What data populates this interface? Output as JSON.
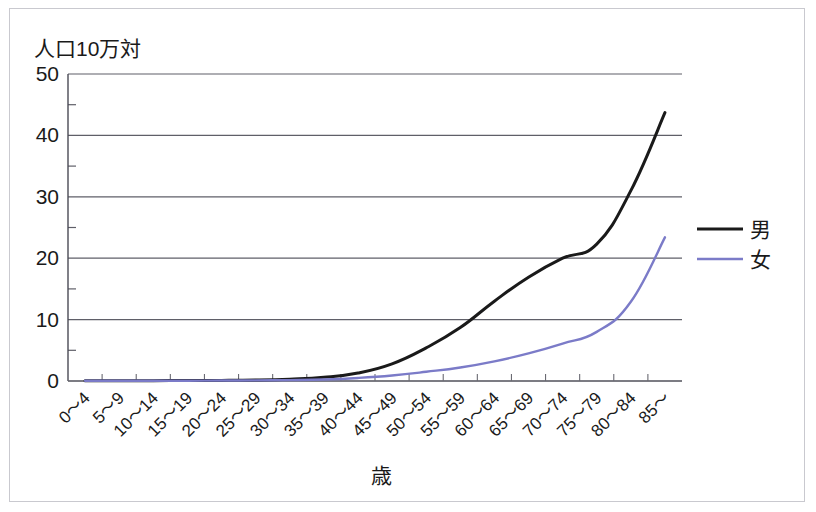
{
  "chart_data": {
    "type": "line",
    "title": "",
    "ylabel": "人口10万対",
    "xlabel": "歳",
    "ylim": [
      0,
      50
    ],
    "yticks": [
      0,
      10,
      20,
      30,
      40,
      50
    ],
    "ytick_labels": [
      "0",
      "10",
      "20",
      "30",
      "40",
      "50"
    ],
    "minor_ytick_step": 5,
    "grid": "horizontal",
    "legend_position": "right",
    "categories": [
      "0～4",
      "5～9",
      "10～14",
      "15～19",
      "20～24",
      "25～29",
      "30～34",
      "35～39",
      "40～44",
      "45～49",
      "50～54",
      "55～59",
      "60～64",
      "65～69",
      "70～74",
      "75～79",
      "80～84",
      "85～"
    ],
    "series": [
      {
        "name": "男",
        "color": "#1a1a1a",
        "values": [
          0.05,
          0.05,
          0.05,
          0.1,
          0.1,
          0.15,
          0.3,
          0.6,
          1.3,
          2.8,
          5.4,
          8.7,
          13.0,
          16.9,
          20.0,
          22.3,
          31.0,
          43.7
        ]
      },
      {
        "name": "女",
        "color": "#7b7bc8",
        "values": [
          0.05,
          0.05,
          0.05,
          0.05,
          0.08,
          0.1,
          0.15,
          0.25,
          0.5,
          0.9,
          1.5,
          2.2,
          3.2,
          4.5,
          6.1,
          8.0,
          12.9,
          23.4
        ]
      }
    ]
  },
  "legend": {
    "items": [
      {
        "label": "男",
        "color": "#1a1a1a"
      },
      {
        "label": "女",
        "color": "#7b7bc8"
      }
    ]
  },
  "axes": {
    "y_axis_unit_label": "人口10万対",
    "x_axis_title": "歳"
  }
}
